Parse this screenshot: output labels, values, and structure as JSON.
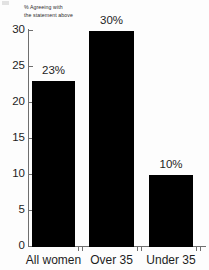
{
  "chart_data": {
    "type": "bar",
    "title": "",
    "subtitle": "% Agreeing with the statement above",
    "subtitle_line1": "% Agreeing with",
    "subtitle_line2": "the statement above",
    "categories": [
      "All women",
      "Over 35",
      "Under 35"
    ],
    "values": [
      23,
      30,
      10
    ],
    "data_labels": [
      "23%",
      "30%",
      "10%"
    ],
    "xlabel": "",
    "ylabel": "",
    "ylim": [
      0,
      30
    ],
    "y_ticks": [
      0,
      5,
      10,
      15,
      20,
      25,
      30
    ],
    "y_tick_labels": [
      "0",
      "5",
      "10",
      "15",
      "20",
      "25",
      "30"
    ],
    "grid": false,
    "legend": false,
    "bar_color": "#000000",
    "axis_color": "#6f6f6f",
    "text_color": "#1d1d1d",
    "background_color": "#fdfdfd"
  }
}
